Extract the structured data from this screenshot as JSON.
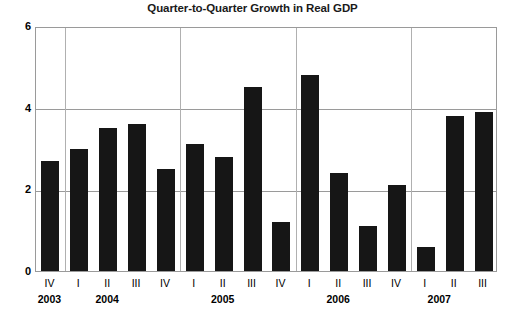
{
  "chart_data": {
    "type": "bar",
    "title": "Quarter-to-Quarter Growth in Real GDP",
    "xlabel": "",
    "ylabel": "Percent",
    "ylim": [
      0,
      6
    ],
    "yticks": [
      "0",
      "2",
      "4",
      "6"
    ],
    "ytick_values": [
      0,
      2,
      4,
      6
    ],
    "grid": true,
    "legend": null,
    "categories": [
      "IV",
      "I",
      "II",
      "III",
      "IV",
      "I",
      "II",
      "III",
      "IV",
      "I",
      "II",
      "III",
      "IV",
      "I",
      "II",
      "III"
    ],
    "years": [
      "2003",
      "2004",
      "2005",
      "2006",
      "2007"
    ],
    "year_group_sizes": [
      1,
      4,
      4,
      4,
      3
    ],
    "values": [
      2.7,
      3.0,
      3.5,
      3.6,
      2.5,
      3.1,
      2.8,
      4.5,
      1.2,
      4.8,
      2.4,
      1.1,
      2.1,
      0.6,
      3.8,
      3.9
    ],
    "points": [
      {
        "quarter": "IV",
        "year": "2003",
        "value": 2.7
      },
      {
        "quarter": "I",
        "year": "2004",
        "value": 3.0
      },
      {
        "quarter": "II",
        "year": "2004",
        "value": 3.5
      },
      {
        "quarter": "III",
        "year": "2004",
        "value": 3.6
      },
      {
        "quarter": "IV",
        "year": "2004",
        "value": 2.5
      },
      {
        "quarter": "I",
        "year": "2005",
        "value": 3.1
      },
      {
        "quarter": "II",
        "year": "2005",
        "value": 2.8
      },
      {
        "quarter": "III",
        "year": "2005",
        "value": 4.5
      },
      {
        "quarter": "IV",
        "year": "2005",
        "value": 1.2
      },
      {
        "quarter": "I",
        "year": "2006",
        "value": 4.8
      },
      {
        "quarter": "II",
        "year": "2006",
        "value": 2.4
      },
      {
        "quarter": "III",
        "year": "2006",
        "value": 1.1
      },
      {
        "quarter": "IV",
        "year": "2006",
        "value": 2.1
      },
      {
        "quarter": "I",
        "year": "2007",
        "value": 0.6
      },
      {
        "quarter": "II",
        "year": "2007",
        "value": 3.8
      },
      {
        "quarter": "III",
        "year": "2007",
        "value": 3.9
      }
    ],
    "bar_color": "#161616",
    "grid_color": "#9a9a9a",
    "background": "#ffffff"
  }
}
